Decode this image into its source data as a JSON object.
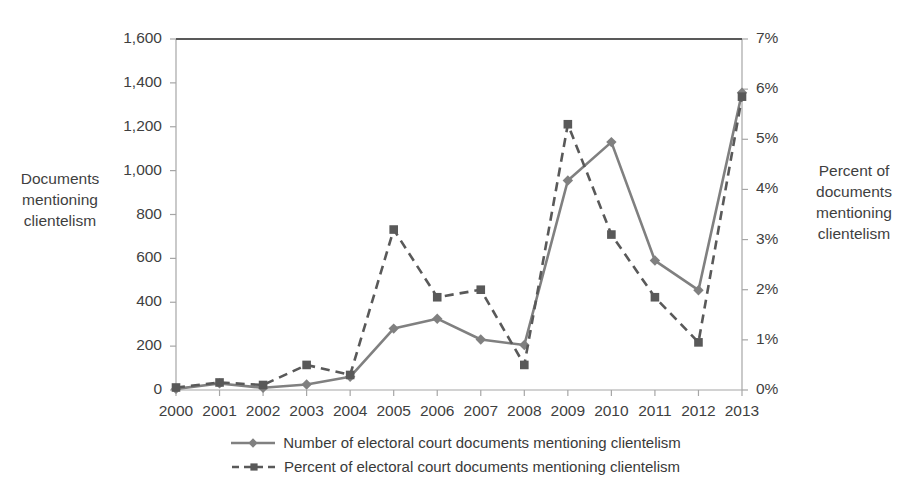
{
  "chart_data": {
    "type": "line",
    "title": "",
    "xlabel": "",
    "categories": [
      "2000",
      "2001",
      "2002",
      "2003",
      "2004",
      "2005",
      "2006",
      "2007",
      "2008",
      "2009",
      "2010",
      "2011",
      "2012",
      "2013"
    ],
    "series": [
      {
        "name": "Number of electoral court documents mentioning clientelism",
        "axis": "left",
        "style": "solid",
        "marker": "diamond",
        "color": "#808080",
        "values": [
          5,
          30,
          10,
          25,
          60,
          280,
          325,
          230,
          205,
          955,
          1130,
          590,
          455,
          1355
        ]
      },
      {
        "name": "Percent of electoral court documents mentioning clientelism",
        "axis": "right",
        "style": "dashed",
        "marker": "square",
        "color": "#595959",
        "values": [
          0.05,
          0.15,
          0.1,
          0.5,
          0.3,
          3.2,
          1.85,
          2.0,
          0.5,
          5.3,
          3.1,
          1.85,
          0.95,
          5.85
        ]
      }
    ],
    "left_axis": {
      "title": "Documents mentioning clientelism",
      "ticks": [
        "0",
        "200",
        "400",
        "600",
        "800",
        "1,000",
        "1,200",
        "1,400",
        "1,600"
      ],
      "min": 0,
      "max": 1600,
      "step": 200
    },
    "right_axis": {
      "title": "Percent of documents mentioning clientelism",
      "ticks": [
        "0%",
        "1%",
        "2%",
        "3%",
        "4%",
        "5%",
        "6%",
        "7%"
      ],
      "min": 0,
      "max": 7,
      "step": 1
    },
    "grid": false,
    "legend_position": "bottom"
  },
  "legend": {
    "items": [
      {
        "label": "Number of electoral court documents mentioning clientelism"
      },
      {
        "label": "Percent of electoral court documents mentioning clientelism"
      }
    ]
  }
}
